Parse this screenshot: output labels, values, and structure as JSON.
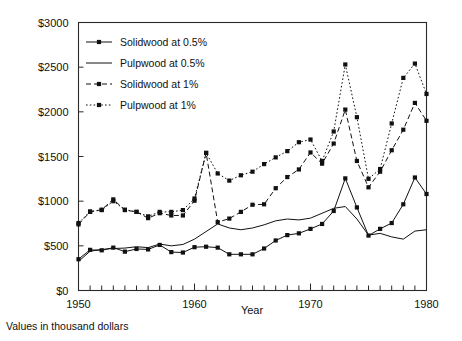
{
  "caption": "Values in thousand dollars",
  "chart_data": {
    "type": "line",
    "title": "",
    "xlabel": "Year",
    "ylabel": "",
    "xlim": [
      1950,
      1980
    ],
    "ylim": [
      0,
      3000
    ],
    "grid": false,
    "legend_position": "top-left",
    "x_ticks": [
      1950,
      1960,
      1970,
      1980
    ],
    "x_tick_labels": [
      "1950",
      "1960",
      "1970",
      "1980"
    ],
    "x_minor_tick_step": 1,
    "y_ticks": [
      0,
      500,
      1000,
      1500,
      2000,
      2500,
      3000
    ],
    "y_tick_labels": [
      "$0",
      "$500",
      "$1000",
      "$1500",
      "$2000",
      "$2500",
      "$3000"
    ],
    "x": [
      1950,
      1951,
      1952,
      1953,
      1954,
      1955,
      1956,
      1957,
      1958,
      1959,
      1960,
      1961,
      1962,
      1963,
      1964,
      1965,
      1966,
      1967,
      1968,
      1969,
      1970,
      1971,
      1972,
      1973,
      1974,
      1975,
      1976,
      1977,
      1978,
      1979,
      1980
    ],
    "series": [
      {
        "name": "Solidwood at 0.5%",
        "style": "solid-with-markers",
        "marker": "square",
        "values": [
          350,
          455,
          450,
          480,
          435,
          465,
          460,
          510,
          430,
          425,
          485,
          490,
          480,
          405,
          405,
          405,
          470,
          560,
          620,
          640,
          690,
          745,
          890,
          1255,
          930,
          615,
          690,
          755,
          965,
          1265,
          1080
        ]
      },
      {
        "name": "Pulpwood at 0.5%",
        "style": "solid-no-markers",
        "marker": "none",
        "values": [
          325,
          440,
          460,
          470,
          475,
          490,
          480,
          520,
          500,
          515,
          575,
          660,
          745,
          700,
          680,
          700,
          735,
          780,
          800,
          790,
          810,
          865,
          920,
          940,
          800,
          620,
          640,
          600,
          575,
          665,
          680
        ]
      },
      {
        "name": "Solidwood at 1%",
        "style": "dashed-with-markers",
        "marker": "square",
        "values": [
          740,
          880,
          905,
          1020,
          900,
          880,
          810,
          865,
          840,
          840,
          1005,
          1540,
          765,
          805,
          880,
          960,
          965,
          1145,
          1270,
          1355,
          1545,
          1420,
          1645,
          2025,
          1450,
          1155,
          1330,
          1570,
          1800,
          2100,
          1900
        ]
      },
      {
        "name": "Pulpwood at 1%",
        "style": "dotted-with-markers",
        "marker": "square",
        "values": [
          755,
          885,
          900,
          1000,
          905,
          880,
          830,
          880,
          880,
          900,
          1030,
          1540,
          1310,
          1230,
          1290,
          1330,
          1415,
          1490,
          1560,
          1660,
          1690,
          1450,
          1780,
          2530,
          1940,
          1250,
          1360,
          1870,
          2380,
          2540,
          2200
        ]
      }
    ]
  },
  "legend": {
    "items": [
      {
        "label": "Solidwood at 0.5%"
      },
      {
        "label": "Pulpwood at 0.5%"
      },
      {
        "label": "Solidwood at 1%"
      },
      {
        "label": "Pulpwood at 1%"
      }
    ]
  }
}
